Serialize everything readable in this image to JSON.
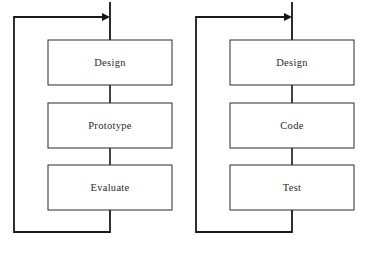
{
  "figure": {
    "type": "flow-diagram",
    "background_color": "#ffffff",
    "line_color": "#161616",
    "box_stroke_color": "#2b2b2b",
    "box_fill_color": "#ffffff",
    "text_color": "#2a2a2a"
  },
  "diagrams": [
    {
      "id": "left-cycle",
      "name": "design-prototype-evaluate-cycle",
      "origin_x": 0,
      "boxes": [
        {
          "label": "Design",
          "x": 48,
          "y": 40,
          "w": 124,
          "h": 45
        },
        {
          "label": "Prototype",
          "x": 48,
          "y": 103,
          "w": 124,
          "h": 45
        },
        {
          "label": "Evaluate",
          "x": 48,
          "y": 165,
          "w": 124,
          "h": 45
        }
      ],
      "entry_line": {
        "x": 110,
        "y1": 2,
        "y2": 40
      },
      "connectors": [
        {
          "x": 110,
          "y1": 85,
          "y2": 103
        },
        {
          "x": 110,
          "y1": 148,
          "y2": 165
        }
      ],
      "feedback_loop": {
        "from_x": 110,
        "from_y": 210,
        "bottom_y": 232,
        "left_x": 14,
        "top_y": 17,
        "to_x": 108
      },
      "arrow": {
        "tip_x": 108,
        "tip_y": 17,
        "size": 6
      }
    },
    {
      "id": "right-cycle",
      "name": "design-code-test-cycle",
      "origin_x": 182,
      "boxes": [
        {
          "label": "Design",
          "x": 230,
          "y": 40,
          "w": 124,
          "h": 45
        },
        {
          "label": "Code",
          "x": 230,
          "y": 103,
          "w": 124,
          "h": 45
        },
        {
          "label": "Test",
          "x": 230,
          "y": 165,
          "w": 124,
          "h": 45
        }
      ],
      "entry_line": {
        "x": 292,
        "y1": 2,
        "y2": 40
      },
      "connectors": [
        {
          "x": 292,
          "y1": 85,
          "y2": 103
        },
        {
          "x": 292,
          "y1": 148,
          "y2": 165
        }
      ],
      "feedback_loop": {
        "from_x": 292,
        "from_y": 210,
        "bottom_y": 232,
        "left_x": 196,
        "top_y": 17,
        "to_x": 290
      },
      "arrow": {
        "tip_x": 290,
        "tip_y": 17,
        "size": 6
      }
    }
  ],
  "labels": {
    "left": {
      "box0": "Design",
      "box1": "Prototype",
      "box2": "Evaluate"
    },
    "right": {
      "box0": "Design",
      "box1": "Code",
      "box2": "Test"
    }
  }
}
